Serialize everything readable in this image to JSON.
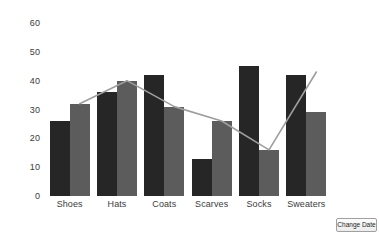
{
  "chart_data": {
    "type": "bar",
    "title": "",
    "xlabel": "",
    "ylabel": "",
    "ylim": [
      0,
      60
    ],
    "yticks": [
      0,
      10,
      20,
      30,
      40,
      50,
      60
    ],
    "grid": false,
    "legend": "none",
    "categories": [
      "Shoes",
      "Hats",
      "Coats",
      "Scarves",
      "Socks",
      "Sweaters"
    ],
    "series": [
      {
        "name": "Series 1",
        "type": "bar",
        "color": "#262626",
        "values": [
          26,
          36,
          42,
          13,
          45,
          42
        ]
      },
      {
        "name": "Series 2",
        "type": "bar",
        "color": "#5c5c5c",
        "values": [
          32,
          40,
          31,
          26,
          16,
          29
        ]
      },
      {
        "name": "Series 3",
        "type": "line",
        "color": "#9e9e9e",
        "values": [
          32,
          40,
          31,
          26,
          16,
          43
        ]
      }
    ]
  },
  "axis": {
    "y_tick_labels": [
      "60",
      "50",
      "40",
      "30",
      "20",
      "10",
      "0"
    ],
    "x_tick_labels": [
      "Shoes",
      "Hats",
      "Coats",
      "Scarves",
      "Socks",
      "Sweaters"
    ]
  },
  "controls": {
    "change_date_label": "Change Date"
  },
  "colors": {
    "series1": "#262626",
    "series2": "#5c5c5c",
    "line": "#9e9e9e",
    "background": "#ffffff",
    "text": "#3b3b3b"
  }
}
